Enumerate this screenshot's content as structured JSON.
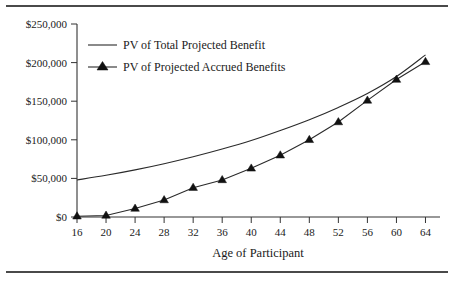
{
  "chart_data": {
    "type": "line",
    "title": "",
    "xlabel": "Age of Participant",
    "ylabel": "",
    "x": [
      16,
      20,
      24,
      28,
      32,
      36,
      40,
      44,
      48,
      52,
      56,
      60,
      64
    ],
    "xlim": [
      16,
      66
    ],
    "ylim": [
      0,
      250000
    ],
    "grid": false,
    "legend_position": "top-left-inside",
    "x_tick_labels": [
      "16",
      "20",
      "24",
      "28",
      "32",
      "36",
      "40",
      "44",
      "48",
      "52",
      "56",
      "60",
      "64"
    ],
    "y_tick_labels": [
      "$0",
      "$50,000",
      "$100,000",
      "$150,000",
      "$200,000",
      "$250,000"
    ],
    "y_tick_values": [
      0,
      50000,
      100000,
      150000,
      200000,
      250000
    ],
    "series": [
      {
        "name": "PV of Total Projected Benefit",
        "marker": "none",
        "values": [
          48000,
          54000,
          61000,
          69000,
          78000,
          88000,
          99000,
          112000,
          126000,
          142000,
          160000,
          182000,
          210000
        ]
      },
      {
        "name": "PV of Projected Accrued Benefits",
        "marker": "triangle",
        "values": [
          1000,
          2000,
          11000,
          22000,
          38000,
          48000,
          63000,
          80000,
          100000,
          123000,
          151000,
          178000,
          201000
        ]
      }
    ]
  },
  "legend": {
    "items": [
      {
        "label": "PV of Total Projected Benefit",
        "marker": "line"
      },
      {
        "label": "PV of Projected Accrued Benefits",
        "marker": "triangle-line"
      }
    ]
  },
  "axis": {
    "x_title": "Age of Participant"
  }
}
